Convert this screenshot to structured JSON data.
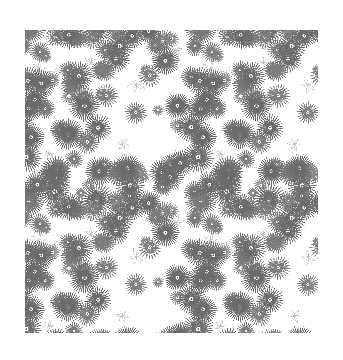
{
  "artwork": {
    "title": "Seamless Daisy Floral Line-Art Pattern",
    "medium": "monochrome vector line drawing",
    "subject": "repeating field of many-petalled daisy / aster / chrysanthemum blossoms",
    "canvas": {
      "width": 343,
      "height": 360,
      "background_color": "#ffffff"
    },
    "pattern_area": {
      "x": 25,
      "y": 30,
      "width": 293,
      "height": 303,
      "description": "swatch of the repeating pattern, centered with white margin on all sides"
    },
    "tile": {
      "repeat_width": 172,
      "repeat_height": 172,
      "seamless": true,
      "columns": 2,
      "rows": 2,
      "note": "motif visibly repeats horizontally about every 172 px; edges are cropped mid-flower"
    },
    "palette": {
      "background": "#ffffff",
      "stroke_dark": "#6b6b6b",
      "stroke_mid": "#8a8a8a",
      "stroke_light": "#b4b4b4",
      "stroke_faint": "#cccccc"
    },
    "line_work": {
      "stroke_width_main": 0.5,
      "stroke_width_accent": 0.4,
      "fill": "none",
      "style": "thin uniform outline, no shading, no color fill"
    },
    "motifs": [
      {
        "name": "large-aster-bloom",
        "petal_count_range": [
          30,
          40
        ],
        "diameter_range": [
          26,
          34
        ],
        "center": "concentric rings with small dot",
        "stroke": "#6b6b6b",
        "density": "dominant"
      },
      {
        "name": "medium-daisy-bloom",
        "petal_count_range": [
          20,
          30
        ],
        "diameter_range": [
          18,
          26
        ],
        "center": "single ring with dot",
        "stroke": "#7c7c7c",
        "density": "common"
      },
      {
        "name": "small-daisy-bloom",
        "petal_count_range": [
          14,
          22
        ],
        "diameter_range": [
          11,
          18
        ],
        "center": "small dot",
        "stroke": "#8a8a8a",
        "density": "scattered"
      },
      {
        "name": "outline-petal-sprig",
        "petal_count_range": [
          3,
          6
        ],
        "diameter_range": [
          10,
          20
        ],
        "center": "open",
        "stroke": "#bdbdbd",
        "density": "fills gaps between blooms"
      }
    ],
    "composition": {
      "coverage": "dense all-over / ditsy",
      "whitespace": "small irregular gaps between overlapping blooms",
      "orientation": "blooms rotated at random angles",
      "symmetry": "none (random scatter within a repeating tile)"
    }
  },
  "labels": {
    "canvas_label": "floral pattern artboard",
    "pattern_label": "seamless daisy repeat"
  }
}
